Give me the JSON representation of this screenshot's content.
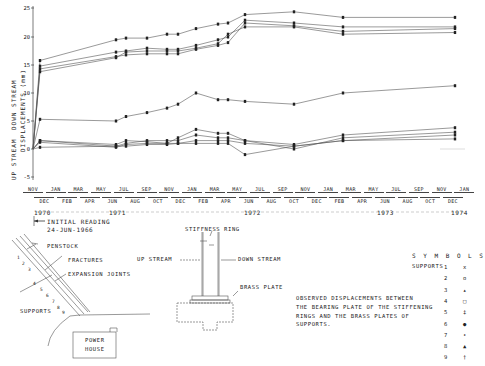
{
  "chart_data": {
    "type": "line",
    "ylabel": "DISPLACEMENTS (mm)",
    "ylabel_direction_top": "DOWN STREAM",
    "ylabel_direction_bottom": "UP STREAM",
    "ylim": [
      -5,
      25
    ],
    "yticks": [
      25,
      20,
      15,
      10,
      5,
      0,
      -5
    ],
    "xlabel_years": [
      "1970",
      "1971",
      "1972",
      "1973",
      "1974"
    ],
    "x": [
      "Jun-1966 (initial)",
      "Nov-1970",
      "Jun-1971",
      "Jul-1971",
      "Sep-1971",
      "Nov-1971",
      "Dec-1971",
      "Feb-1972",
      "Apr-1972",
      "May-1972",
      "Jun-1972",
      "Oct-1972",
      "Mar-1973",
      "Jan-1974"
    ],
    "x_px": [
      33,
      40,
      116,
      126,
      147,
      167,
      178,
      196,
      218,
      228,
      245,
      294,
      343,
      455
    ],
    "series": [
      {
        "name": "Support 1",
        "values": [
          0,
          15.8,
          19.5,
          19.8,
          19.8,
          20.5,
          20.5,
          21.5,
          22.3,
          22.5,
          24.0,
          24.5,
          23.5,
          23.5
        ]
      },
      {
        "name": "Support 2",
        "values": [
          0,
          14.8,
          17.3,
          17.5,
          18.0,
          17.8,
          17.8,
          18.5,
          19.5,
          20.0,
          23.0,
          22.5,
          21.8,
          21.8
        ]
      },
      {
        "name": "Support 3",
        "values": [
          0,
          14.3,
          16.5,
          16.8,
          17.0,
          17.0,
          17.0,
          17.8,
          18.5,
          19.0,
          22.5,
          22.0,
          21.0,
          21.5
        ]
      },
      {
        "name": "Support 4",
        "values": [
          0,
          13.8,
          16.3,
          17.3,
          17.5,
          17.5,
          17.5,
          18.0,
          18.8,
          20.5,
          21.8,
          21.8,
          20.5,
          20.8
        ]
      },
      {
        "name": "Support 5",
        "values": [
          0,
          5.3,
          5.0,
          5.8,
          6.5,
          7.3,
          8.0,
          10.0,
          8.8,
          8.8,
          8.5,
          8.0,
          10.0,
          11.3
        ]
      },
      {
        "name": "Support 6",
        "values": [
          0,
          1.5,
          0.8,
          1.5,
          1.3,
          1.0,
          2.0,
          3.5,
          2.8,
          2.8,
          1.5,
          0.8,
          2.5,
          3.8
        ]
      },
      {
        "name": "Support 7",
        "values": [
          0,
          1.5,
          0.5,
          1.0,
          1.5,
          1.5,
          1.5,
          2.5,
          2.0,
          2.0,
          1.5,
          0.0,
          2.0,
          3.0
        ]
      },
      {
        "name": "Support 8",
        "values": [
          0,
          1.2,
          0.3,
          0.8,
          1.0,
          1.0,
          1.0,
          1.5,
          1.5,
          1.5,
          1.0,
          0.5,
          1.5,
          2.5
        ]
      },
      {
        "name": "Support 9",
        "values": [
          0,
          0.3,
          0.5,
          0.5,
          0.8,
          0.8,
          1.0,
          1.0,
          1.0,
          1.0,
          -1.0,
          0.5,
          1.5,
          1.8
        ]
      }
    ],
    "grid": false,
    "legend_position": "bottom-right"
  },
  "axis": {
    "yticks": [
      "25",
      "20",
      "15",
      "10",
      "5",
      "0",
      "-5"
    ],
    "ylabel_main": "DISPLACEMENTS (mm)",
    "ylabel_down": "DOWN STREAM",
    "ylabel_up": "UP STREAM"
  },
  "months_top": [
    "NOV",
    "JAN",
    "MAR",
    "MAY",
    "JUL",
    "SEP",
    "NOV",
    "JAN",
    "MAR",
    "MAY",
    "JUL",
    "SEP",
    "NOV",
    "JAN",
    "MAR",
    "MAY",
    "JUL",
    "SEP",
    "NOV",
    "JAN"
  ],
  "months_bottom": [
    "DEC",
    "FEB",
    "APR",
    "JUN",
    "AUG",
    "OCT",
    "DEC",
    "FEB",
    "APR",
    "JUN",
    "AUG",
    "OCT",
    "DEC",
    "FEB",
    "APR",
    "JUN",
    "AUG",
    "OCT",
    "DEC"
  ],
  "years": {
    "y1970": "1970",
    "y1971": "1971",
    "y1972": "1972",
    "y1973": "1973",
    "y1974": "1974"
  },
  "initial_reading": {
    "line1": "INITIAL READING",
    "line2": "24-JUN-1966"
  },
  "penstock_diagram": {
    "penstock": "PENSTOCK",
    "fractures": "FRACTURES",
    "expansion_joints": "EXPANSION JOINTS",
    "supports": "SUPPORTS",
    "power_house_1": "POWER",
    "power_house_2": "HOUSE",
    "support_numbers": [
      "1",
      "2",
      "3",
      "4",
      "5",
      "6",
      "7",
      "8",
      "9"
    ]
  },
  "ring_diagram": {
    "stiffness_ring": "STIFFNESS RING",
    "up_stream": "UP STREAM",
    "down_stream": "DOWN STREAM",
    "brass_plate": "BRASS PLATE"
  },
  "caption": {
    "line1": "OBSERVED DISPLACEMENTS BETWEEN",
    "line2": "THE BEARING PLATE OF THE STIFFENING",
    "line3": "RINGS AND THE BRASS PLATES OF",
    "line4": "SUPPORTS."
  },
  "legend": {
    "title": "S Y M B O L S",
    "prefix": "SUPPORTS",
    "items": [
      {
        "n": "1",
        "sym": "x"
      },
      {
        "n": "2",
        "sym": "o"
      },
      {
        "n": "3",
        "sym": "▴"
      },
      {
        "n": "4",
        "sym": "□"
      },
      {
        "n": "5",
        "sym": "‡"
      },
      {
        "n": "6",
        "sym": "●"
      },
      {
        "n": "7",
        "sym": "•"
      },
      {
        "n": "8",
        "sym": "▲"
      },
      {
        "n": "9",
        "sym": "†"
      }
    ]
  }
}
